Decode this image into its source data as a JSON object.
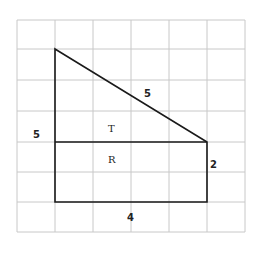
{
  "diagram": {
    "type": "composite figure on grid",
    "grid": {
      "columns": 6,
      "rows": 6
    },
    "regions": {
      "triangle": "T",
      "rectangle": "R"
    },
    "labels": {
      "left_side": "5",
      "hypotenuse": "5",
      "right_side": "2",
      "bottom": "4",
      "triangle_region": "T",
      "rectangle_region": "R"
    }
  }
}
